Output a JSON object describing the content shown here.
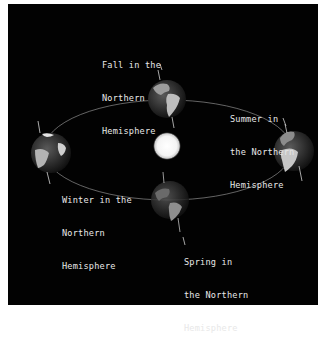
{
  "diagram": {
    "background": "#020202",
    "frame": "#ffffff",
    "sun": {
      "label": "",
      "color": "#ffffff"
    },
    "orbit_color": "#9a9a9a",
    "labels": [
      {
        "id": "fall",
        "lines": [
          "Fall in the",
          "Northern",
          "Hemisphere"
        ]
      },
      {
        "id": "summer",
        "lines": [
          "Summer in",
          "the Northern",
          "Hemisphere"
        ]
      },
      {
        "id": "winter",
        "lines": [
          "Winter in the",
          "Northern",
          "Hemisphere"
        ]
      },
      {
        "id": "spring",
        "lines": [
          "Spring in",
          "the Northern",
          "Hemisphere"
        ]
      }
    ],
    "globes": [
      {
        "id": "fall-earth",
        "position": "top"
      },
      {
        "id": "summer-earth",
        "position": "right"
      },
      {
        "id": "winter-earth",
        "position": "left"
      },
      {
        "id": "spring-earth",
        "position": "bottom"
      }
    ]
  }
}
